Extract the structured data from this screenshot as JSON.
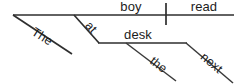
{
  "diagram": {
    "type": "reed-kellogg-sentence-diagram",
    "sentence": "The boy at the desk read next",
    "canvas": {
      "width": 242,
      "height": 84,
      "background": "#ffffff"
    },
    "stroke_color": "#2e2e2e",
    "text_color": "#1c1c1c",
    "words": {
      "subject": "boy",
      "verb": "read",
      "subject_article": "The",
      "preposition": "at",
      "prep_object": "desk",
      "prep_object_article": "the",
      "adverb": "next"
    },
    "labels": [
      {
        "id": "subject",
        "text": "boy",
        "x": 131,
        "y": 11,
        "rotation": 0,
        "role": "subject",
        "anchor": "middle"
      },
      {
        "id": "verb",
        "text": "read",
        "x": 204,
        "y": 11,
        "rotation": 0,
        "role": "verb",
        "anchor": "middle"
      },
      {
        "id": "subject-article",
        "text": "The",
        "x": 40,
        "y": 40,
        "rotation": 33,
        "role": "article-modifier",
        "anchor": "middle"
      },
      {
        "id": "preposition",
        "text": "at",
        "x": 88,
        "y": 30,
        "rotation": 48,
        "role": "preposition",
        "anchor": "middle"
      },
      {
        "id": "prep-object",
        "text": "desk",
        "x": 138,
        "y": 39,
        "rotation": 0,
        "role": "object-of-preposition",
        "anchor": "middle"
      },
      {
        "id": "prep-object-article",
        "text": "the",
        "x": 156,
        "y": 68,
        "rotation": 38,
        "role": "article-modifier",
        "anchor": "middle"
      },
      {
        "id": "adverb",
        "text": "next",
        "x": 209,
        "y": 66,
        "rotation": 40,
        "role": "adverb-modifier",
        "anchor": "middle"
      }
    ],
    "lines": [
      {
        "id": "baseline",
        "role": "main-baseline",
        "x1": 13,
        "y1": 15,
        "x2": 234,
        "y2": 15
      },
      {
        "id": "subject-verb-divider",
        "role": "subject-predicate-divider",
        "x1": 166,
        "y1": 3,
        "x2": 166,
        "y2": 25
      },
      {
        "id": "the-slant",
        "role": "article-slant-subject",
        "x1": 13,
        "y1": 15,
        "x2": 72,
        "y2": 54
      },
      {
        "id": "at-slant",
        "role": "preposition-slant",
        "x1": 74,
        "y1": 15,
        "x2": 99,
        "y2": 43
      },
      {
        "id": "desk-baseline",
        "role": "prepositional-object-line",
        "x1": 98,
        "y1": 43,
        "x2": 187,
        "y2": 43
      },
      {
        "id": "the-slant-2",
        "role": "article-slant-object",
        "x1": 126,
        "y1": 43,
        "x2": 176,
        "y2": 81
      },
      {
        "id": "next-slant",
        "role": "adverb-slant",
        "x1": 186,
        "y1": 43,
        "x2": 233,
        "y2": 83
      }
    ]
  }
}
